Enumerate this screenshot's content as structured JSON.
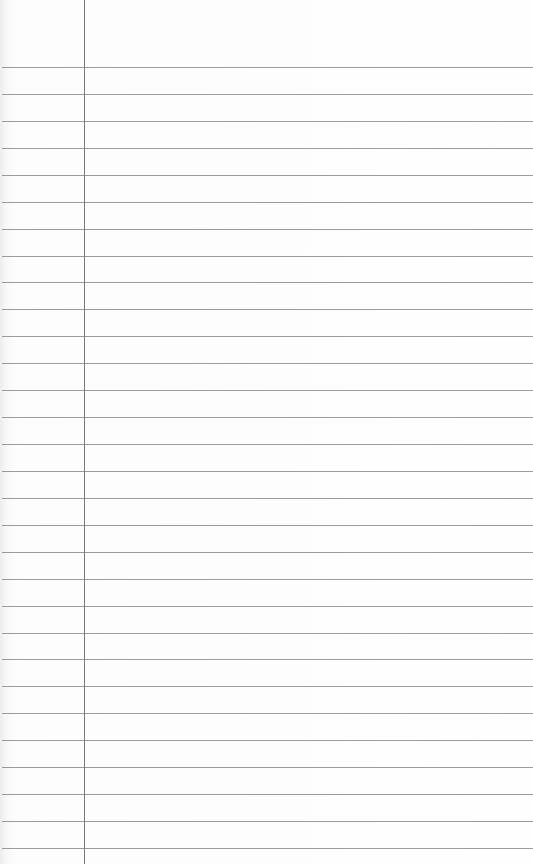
{
  "paper": {
    "type": "lined notepad paper",
    "background_color": "#fdfdfd",
    "rule_color": "#8a8a8a",
    "margin_line_color": "#7a7a7a",
    "margin_x": 84,
    "first_rule_y": 67,
    "rule_spacing": 26.93,
    "rule_count": 30
  }
}
